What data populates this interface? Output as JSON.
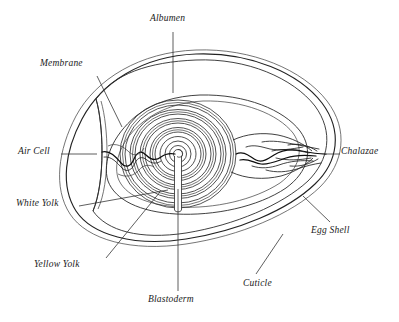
{
  "diagram": {
    "subject": "egg",
    "view": "longitudinal cross-section",
    "background_color": "#ffffff",
    "ink_color": "#222222",
    "label_style": "italic serif"
  },
  "labels": [
    {
      "id": "albumen",
      "text": "Albumen",
      "position": "top-center",
      "text_x": 150,
      "text_y": 20,
      "leader": {
        "x1": 173,
        "y1": 32,
        "x2": 173,
        "y2": 93
      }
    },
    {
      "id": "membrane",
      "text": "Membrane",
      "position": "upper-left",
      "text_x": 40,
      "text_y": 65,
      "leader": {
        "x1": 97,
        "y1": 76,
        "x2": 122,
        "y2": 127
      }
    },
    {
      "id": "air-cell",
      "text": "Air Cell",
      "position": "mid-left",
      "text_x": 18,
      "text_y": 147,
      "leader": {
        "x1": 61,
        "y1": 154,
        "x2": 97,
        "y2": 154
      }
    },
    {
      "id": "white-yolk",
      "text": "White Yolk",
      "position": "lower-left",
      "text_x": 16,
      "text_y": 200,
      "leader": {
        "x1": 79,
        "y1": 206,
        "x2": 168,
        "y2": 190
      }
    },
    {
      "id": "yellow-yolk",
      "text": "Yellow Yolk",
      "position": "bottom-left",
      "text_x": 34,
      "text_y": 262,
      "leader": {
        "x1": 106,
        "y1": 258,
        "x2": 160,
        "y2": 192
      }
    },
    {
      "id": "blastoderm",
      "text": "Blastoderm",
      "position": "bottom-center",
      "text_x": 148,
      "text_y": 297,
      "leader": {
        "x1": 178,
        "y1": 291,
        "x2": 178,
        "y2": 189
      }
    },
    {
      "id": "cuticle",
      "text": "Cuticle",
      "position": "bottom-right",
      "text_x": 243,
      "text_y": 281,
      "leader": {
        "x1": 256,
        "y1": 274,
        "x2": 283,
        "y2": 234
      }
    },
    {
      "id": "egg-shell",
      "text": "Egg Shell",
      "position": "right-lower",
      "text_x": 311,
      "text_y": 228,
      "leader": {
        "x1": 330,
        "y1": 222,
        "x2": 303,
        "y2": 196
      }
    },
    {
      "id": "chalazae",
      "text": "Chalazae",
      "position": "right",
      "text_x": 341,
      "text_y": 147,
      "leader": {
        "x1": 326,
        "y1": 154,
        "x2": 340,
        "y2": 154
      }
    }
  ],
  "structures": [
    {
      "id": "egg-shell-outline",
      "name": "Egg Shell",
      "description": "outer oval shell wall, blunt at left, pointed at right"
    },
    {
      "id": "cuticle-line",
      "name": "Cuticle",
      "description": "thin outermost line following the shell"
    },
    {
      "id": "shell-membrane",
      "name": "Membrane",
      "description": "inner membrane line separating from shell at the blunt end"
    },
    {
      "id": "air-cell-region",
      "name": "Air Cell",
      "description": "lens-shaped gap at the blunt left end between shell and membrane"
    },
    {
      "id": "albumen-region",
      "name": "Albumen",
      "description": "clear region between membrane and yolk"
    },
    {
      "id": "yolk-rings",
      "name": "Yellow Yolk",
      "description": "concentric rings of yellow yolk around the latebra"
    },
    {
      "id": "white-yolk-layers",
      "name": "White Yolk",
      "description": "alternating pale rings within the yolk"
    },
    {
      "id": "latebra-neck",
      "name": "Latebra",
      "description": "narrow channel from yolk center downward"
    },
    {
      "id": "blastoderm-spot",
      "name": "Blastoderm",
      "description": "germinal disc at the yolk centre"
    },
    {
      "id": "chalazae-right",
      "name": "Chalazae",
      "description": "twisted dark strands at the pointed right end"
    },
    {
      "id": "chalazae-left",
      "name": "Chalazae",
      "description": "wavy strand at the blunt left end"
    }
  ]
}
